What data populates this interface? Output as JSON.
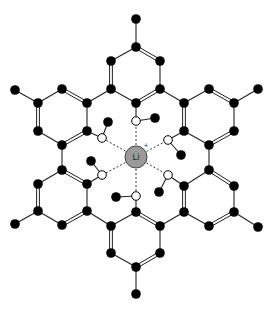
{
  "diagram": {
    "center_ion": {
      "label": "Li",
      "charge": "+",
      "x": 136,
      "y": 157,
      "r": 11,
      "fill": "#9a9a9a"
    },
    "colors": {
      "bond": "#222222",
      "atom": "#000000",
      "open_atom_fill": "#ffffff",
      "dashed": "#333333"
    },
    "atoms": [
      [
        136,
        19
      ],
      [
        136,
        47
      ],
      [
        111,
        61
      ],
      [
        160,
        61
      ],
      [
        111,
        89
      ],
      [
        160,
        89
      ],
      [
        136,
        103
      ],
      [
        15,
        90
      ],
      [
        38,
        103
      ],
      [
        62,
        89
      ],
      [
        38,
        131
      ],
      [
        62,
        145
      ],
      [
        87,
        103
      ],
      [
        87,
        131
      ],
      [
        258,
        89
      ],
      [
        234,
        103
      ],
      [
        209,
        89
      ],
      [
        234,
        131
      ],
      [
        209,
        145
      ],
      [
        184,
        131
      ],
      [
        184,
        103
      ],
      [
        62,
        170
      ],
      [
        38,
        184
      ],
      [
        38,
        211
      ],
      [
        15,
        224
      ],
      [
        62,
        225
      ],
      [
        87,
        211
      ],
      [
        87,
        184
      ],
      [
        209,
        170
      ],
      [
        234,
        186
      ],
      [
        234,
        212
      ],
      [
        258,
        227
      ],
      [
        209,
        226
      ],
      [
        184,
        212
      ],
      [
        184,
        186
      ],
      [
        136,
        212
      ],
      [
        111,
        226
      ],
      [
        160,
        226
      ],
      [
        111,
        253
      ],
      [
        160,
        253
      ],
      [
        136,
        267
      ],
      [
        136,
        294
      ],
      [
        155,
        118
      ],
      [
        108,
        122
      ],
      [
        181,
        155
      ],
      [
        91,
        161
      ],
      [
        159,
        192
      ],
      [
        116,
        197
      ]
    ],
    "bonds": [
      [
        [
          136,
          19
        ],
        [
          136,
          47
        ],
        1
      ],
      [
        [
          136,
          47
        ],
        [
          111,
          61
        ],
        1
      ],
      [
        [
          136,
          47
        ],
        [
          160,
          61
        ],
        2
      ],
      [
        [
          111,
          61
        ],
        [
          111,
          89
        ],
        2
      ],
      [
        [
          160,
          61
        ],
        [
          160,
          89
        ],
        1
      ],
      [
        [
          111,
          89
        ],
        [
          136,
          103
        ],
        1
      ],
      [
        [
          160,
          89
        ],
        [
          136,
          103
        ],
        2
      ],
      [
        [
          111,
          89
        ],
        [
          87,
          103
        ],
        1
      ],
      [
        [
          160,
          89
        ],
        [
          184,
          103
        ],
        1
      ],
      [
        [
          15,
          90
        ],
        [
          38,
          103
        ],
        1
      ],
      [
        [
          38,
          103
        ],
        [
          62,
          89
        ],
        1
      ],
      [
        [
          62,
          89
        ],
        [
          87,
          103
        ],
        2
      ],
      [
        [
          38,
          103
        ],
        [
          38,
          131
        ],
        2
      ],
      [
        [
          38,
          131
        ],
        [
          62,
          145
        ],
        1
      ],
      [
        [
          62,
          145
        ],
        [
          87,
          131
        ],
        2
      ],
      [
        [
          87,
          103
        ],
        [
          87,
          131
        ],
        1
      ],
      [
        [
          258,
          89
        ],
        [
          234,
          103
        ],
        1
      ],
      [
        [
          234,
          103
        ],
        [
          209,
          89
        ],
        2
      ],
      [
        [
          209,
          89
        ],
        [
          184,
          103
        ],
        1
      ],
      [
        [
          234,
          103
        ],
        [
          234,
          131
        ],
        1
      ],
      [
        [
          234,
          131
        ],
        [
          209,
          145
        ],
        2
      ],
      [
        [
          209,
          145
        ],
        [
          184,
          131
        ],
        1
      ],
      [
        [
          184,
          103
        ],
        [
          184,
          131
        ],
        2
      ],
      [
        [
          62,
          145
        ],
        [
          62,
          170
        ],
        1
      ],
      [
        [
          209,
          145
        ],
        [
          209,
          170
        ],
        1
      ],
      [
        [
          62,
          170
        ],
        [
          38,
          184
        ],
        1
      ],
      [
        [
          62,
          170
        ],
        [
          87,
          184
        ],
        2
      ],
      [
        [
          38,
          184
        ],
        [
          38,
          211
        ],
        2
      ],
      [
        [
          38,
          211
        ],
        [
          15,
          224
        ],
        1
      ],
      [
        [
          38,
          211
        ],
        [
          62,
          225
        ],
        1
      ],
      [
        [
          62,
          225
        ],
        [
          87,
          211
        ],
        2
      ],
      [
        [
          87,
          211
        ],
        [
          87,
          184
        ],
        1
      ],
      [
        [
          209,
          170
        ],
        [
          184,
          186
        ],
        1
      ],
      [
        [
          209,
          170
        ],
        [
          234,
          186
        ],
        2
      ],
      [
        [
          234,
          186
        ],
        [
          234,
          212
        ],
        1
      ],
      [
        [
          234,
          212
        ],
        [
          258,
          227
        ],
        1
      ],
      [
        [
          234,
          212
        ],
        [
          209,
          226
        ],
        2
      ],
      [
        [
          209,
          226
        ],
        [
          184,
          212
        ],
        1
      ],
      [
        [
          184,
          212
        ],
        [
          184,
          186
        ],
        2
      ],
      [
        [
          87,
          211
        ],
        [
          111,
          226
        ],
        1
      ],
      [
        [
          184,
          212
        ],
        [
          160,
          226
        ],
        1
      ],
      [
        [
          136,
          212
        ],
        [
          111,
          226
        ],
        1
      ],
      [
        [
          136,
          212
        ],
        [
          160,
          226
        ],
        2
      ],
      [
        [
          111,
          226
        ],
        [
          111,
          253
        ],
        2
      ],
      [
        [
          160,
          226
        ],
        [
          160,
          253
        ],
        1
      ],
      [
        [
          111,
          253
        ],
        [
          136,
          267
        ],
        1
      ],
      [
        [
          160,
          253
        ],
        [
          136,
          267
        ],
        2
      ],
      [
        [
          136,
          267
        ],
        [
          136,
          294
        ],
        1
      ],
      [
        [
          136,
          103
        ],
        [
          136,
          121
        ],
        1
      ],
      [
        [
          136,
          121
        ],
        [
          155,
          118
        ],
        1
      ],
      [
        [
          87,
          131
        ],
        [
          102,
          138
        ],
        1
      ],
      [
        [
          102,
          138
        ],
        [
          108,
          122
        ],
        1
      ],
      [
        [
          184,
          131
        ],
        [
          168,
          140
        ],
        1
      ],
      [
        [
          168,
          140
        ],
        [
          181,
          155
        ],
        1
      ],
      [
        [
          87,
          184
        ],
        [
          102,
          175
        ],
        1
      ],
      [
        [
          102,
          175
        ],
        [
          91,
          161
        ],
        1
      ],
      [
        [
          184,
          186
        ],
        [
          168,
          175
        ],
        1
      ],
      [
        [
          168,
          175
        ],
        [
          159,
          192
        ],
        1
      ],
      [
        [
          136,
          212
        ],
        [
          136,
          196
        ],
        1
      ],
      [
        [
          136,
          196
        ],
        [
          116,
          197
        ],
        1
      ]
    ],
    "open_atoms": [
      [
        136,
        121
      ],
      [
        102,
        138
      ],
      [
        168,
        140
      ],
      [
        102,
        175
      ],
      [
        168,
        175
      ],
      [
        136,
        196
      ]
    ],
    "coordination_lines": [
      [
        136,
        121
      ],
      [
        102,
        138
      ],
      [
        168,
        140
      ],
      [
        102,
        175
      ],
      [
        168,
        175
      ],
      [
        136,
        196
      ]
    ]
  }
}
